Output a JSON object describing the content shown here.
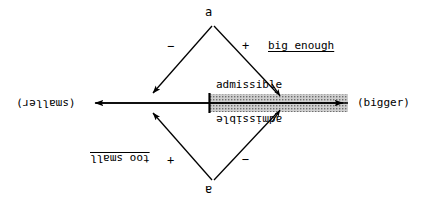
{
  "diagram": {
    "title_text": "admissible range number line",
    "nodes": {
      "top_node": "a",
      "bottom_node": "a"
    },
    "signs": {
      "top_left": "−",
      "top_right": "+",
      "bottom_left": "+",
      "bottom_right": "−"
    },
    "labels": {
      "big_enough": "big enough",
      "too_small": "too small",
      "admissible_top": "admissible",
      "admissible_bottom": "admissible",
      "axis_left": "(smaller)",
      "axis_right": "(bigger)"
    },
    "colors": {
      "ink": "#000000",
      "background": "#ffffff",
      "band_fill": "#b9b9b9",
      "band_dot": "#6e6e6e"
    },
    "geometry": {
      "axis_y": 103,
      "axis_left_x": 86,
      "axis_right_x": 350,
      "band_start_x": 210,
      "band_end_x": 348,
      "band_half_height": 9,
      "tick_x": 209
    }
  }
}
